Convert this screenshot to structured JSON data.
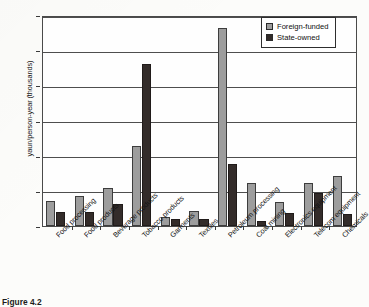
{
  "figure": {
    "caption": "Figure 4.2"
  },
  "legend": {
    "position": "top-right",
    "entries": [
      {
        "label": "Foreign-funded",
        "color": "#9d9d9d"
      },
      {
        "label": "State-owned",
        "color": "#332c2a"
      }
    ]
  },
  "axes": {
    "ylabel": "yaun/person-year (thousands)",
    "yticks": [
      "0",
      "100",
      "200",
      "300",
      "400",
      "500",
      "600"
    ],
    "xlabel": ""
  },
  "chart_data": {
    "type": "bar",
    "title": "",
    "xlabel": "",
    "ylabel": "yaun/person-year (thousands)",
    "ylim": [
      0,
      600
    ],
    "ytick_step": 100,
    "grid": true,
    "legend_position": "top-right",
    "categories": [
      "Food processing",
      "Food products",
      "Beverage products",
      "Tobacco products",
      "Garments",
      "Textiles",
      "Petroleum processing",
      "Coal mining",
      "Electronics equipment",
      "Telecom equipment",
      "Chemicals"
    ],
    "series": [
      {
        "name": "Foreign-funded",
        "color": "#9d9d9d",
        "values": [
          72,
          85,
          108,
          228,
          27,
          43,
          562,
          123,
          69,
          121,
          142
        ]
      },
      {
        "name": "State-owned",
        "color": "#332c2a",
        "values": [
          40,
          39,
          64,
          462,
          20,
          20,
          175,
          15,
          36,
          95,
          33
        ]
      }
    ]
  }
}
